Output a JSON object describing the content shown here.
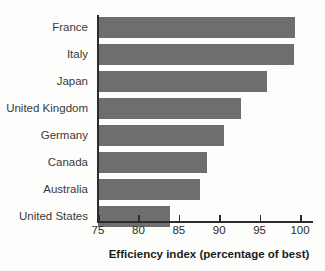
{
  "chart_data": {
    "type": "bar",
    "orientation": "horizontal",
    "title": "",
    "xlabel": "Efficiency index (percentage of best)",
    "ylabel": "",
    "categories": [
      "France",
      "Italy",
      "Japan",
      "United Kingdom",
      "Germany",
      "Canada",
      "Australia",
      "United States"
    ],
    "values": [
      99.4,
      99.2,
      95.9,
      92.7,
      90.6,
      88.5,
      87.6,
      83.9
    ],
    "xlim": [
      75,
      100
    ],
    "xticks": [
      75,
      80,
      85,
      90,
      95,
      100
    ],
    "xtick_labels": [
      "75",
      "80",
      "85",
      "90",
      "95",
      "100"
    ],
    "grid": false,
    "legend": false,
    "bar_color": "#6e6e6e",
    "axis_color": "#2b2b2b",
    "background_color": "#fdfdfc"
  }
}
